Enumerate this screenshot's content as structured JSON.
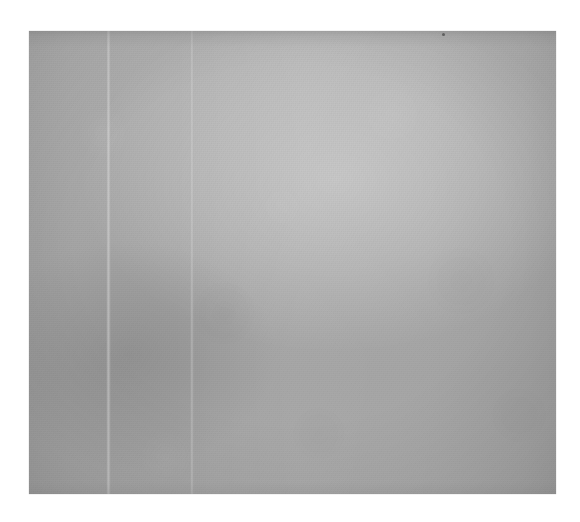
{
  "document": {
    "kind": "scanned-blank-page",
    "description": "Scan of a blank sheet of paper; no printed or handwritten content is visible.",
    "text_content": "",
    "visible_text_lines": []
  },
  "scan": {
    "canvas_width_px": 580,
    "canvas_height_px": 522,
    "background_color": "#ffffff",
    "page_left_px": 29,
    "page_top_px": 31,
    "page_width_px": 527,
    "page_height_px": 463
  },
  "page_tone": {
    "lightest_color": "#b5b5b5",
    "midtone_color": "#aaaaaa",
    "darkest_color": "#9a9a9a",
    "edge_shadow_color": "#8c8c8c",
    "gradient_direction": "light at top and upper-center, darkening toward lower-left"
  },
  "artifacts": {
    "creases": [
      {
        "name": "left-fold-crease",
        "x_px": 106,
        "width_px": 5,
        "tone": "lighter-than-page"
      },
      {
        "name": "center-fold-crease",
        "x_px": 190,
        "width_px": 4,
        "tone": "lighter-than-page"
      }
    ],
    "specks": [
      {
        "name": "dust-speck",
        "x_px": 442,
        "y_px": 33,
        "size_px": 3,
        "color": "#4a4a4a"
      }
    ],
    "edge_shadows": [
      "top",
      "left",
      "right",
      "bottom"
    ],
    "texture": "fine paper grain with faint mottling"
  }
}
